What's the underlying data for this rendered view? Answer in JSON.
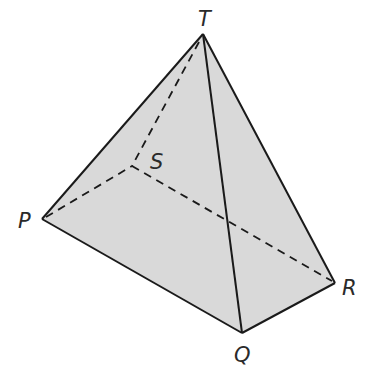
{
  "diagram": {
    "type": "tetrahedron",
    "fill_color": "#d9d9d9",
    "stroke_color": "#1a1a1a",
    "background": "#ffffff",
    "vertices": {
      "T": {
        "label": "T",
        "x": 203,
        "y": 34,
        "label_x": 198,
        "label_y": 26
      },
      "S": {
        "label": "S",
        "x": 132,
        "y": 166,
        "label_x": 150,
        "label_y": 169
      },
      "P": {
        "label": "P",
        "x": 42,
        "y": 219,
        "label_x": 18,
        "label_y": 228
      },
      "R": {
        "label": "R",
        "x": 335,
        "y": 283,
        "label_x": 342,
        "label_y": 295
      },
      "Q": {
        "label": "Q",
        "x": 242,
        "y": 333,
        "label_x": 234,
        "label_y": 362
      }
    },
    "solid_edges": [
      "TP",
      "TQ",
      "TR",
      "PQ",
      "QR"
    ],
    "hidden_edges": [
      "TS",
      "PS",
      "SR"
    ]
  }
}
